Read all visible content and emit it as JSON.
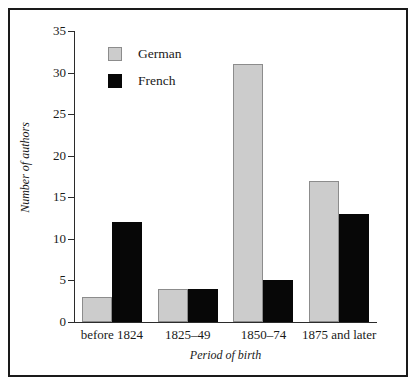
{
  "chart_data": {
    "type": "bar",
    "title": "",
    "xlabel": "Period of birth",
    "ylabel": "Number of authors",
    "categories": [
      "before 1824",
      "1825–49",
      "1850–74",
      "1875 and later"
    ],
    "series": [
      {
        "name": "German",
        "values": [
          3,
          4,
          31,
          17
        ],
        "color": "#cccccc"
      },
      {
        "name": "French",
        "values": [
          12,
          4,
          5,
          13
        ],
        "color": "#070707"
      }
    ],
    "ylim": [
      0,
      35
    ],
    "yticks": [
      0,
      5,
      10,
      15,
      20,
      25,
      30,
      35
    ],
    "ytick_labels": [
      "0",
      "5",
      "10",
      "15",
      "20",
      "25",
      "30",
      "35"
    ],
    "grid": false,
    "legend_position": "upper-left-inside"
  },
  "legend": {
    "entries": [
      {
        "label": "German",
        "swatch": "german-swatch"
      },
      {
        "label": "French",
        "swatch": "french-swatch"
      }
    ]
  },
  "colors": {
    "german": "#cccccc",
    "german_border": "#8c8c8c",
    "french": "#070707",
    "axis": "#2b2b2b",
    "frame": "#1a1a1a",
    "background": "#ffffff"
  }
}
